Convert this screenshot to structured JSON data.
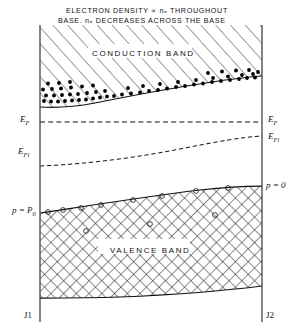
{
  "figure": {
    "domain": "diagram",
    "kind": "semiconductor band diagram",
    "title_line1": "ELECTRON  DENSITY ∝ nₑ THROUGHOUT",
    "title_line2": "BASE.  nₑ DECREASES ACROSS THE BASE",
    "conduction_band_label": "CONDUCTION BAND",
    "valence_band_label": "VALENCE BAND",
    "labels": {
      "ef_left": "E",
      "ef_left_sub": "F",
      "ef_right": "E",
      "ef_right_sub": "F",
      "efi_left": "E",
      "efi_left_sub": "Fi",
      "efi_right": "E",
      "efi_right_sub": "Fi",
      "p_p0": "p = P",
      "p_p0_sub": "0",
      "p_zero": "p = 0",
      "junction_left": "J1",
      "junction_right": "J2"
    },
    "colors": {
      "ink": "#111111",
      "background": "#ffffff",
      "hatch": "#222222",
      "carrier_dot": "#000000",
      "hole_circle": "#333333"
    },
    "geometry": {
      "left_boundary_x": 40,
      "right_boundary_x": 262,
      "top_y": 25,
      "bottom_y": 310,
      "conduction_edge_left_y": 107,
      "conduction_edge_right_y": 76,
      "valence_edge_left_y": 213,
      "valence_edge_right_y": 186,
      "valence_bottom_left_y": 298,
      "valence_bottom_right_y": 286,
      "fermi_level_y": 122,
      "intrinsic_fermi_left_y": 166,
      "intrinsic_fermi_right_y": 136
    }
  }
}
